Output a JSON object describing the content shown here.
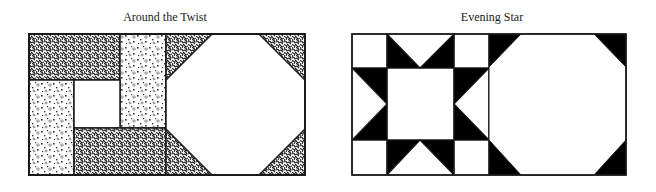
{
  "figures": [
    {
      "title": "Around the Twist",
      "style": "textured",
      "colors": {
        "stroke": "#1a1a1a",
        "dark_texture": "#2a2a2a",
        "light_texture_bg": "#ffffff",
        "plain": "#ffffff"
      },
      "blocks": [
        "around-the-twist-block",
        "snowball-octagon-block"
      ]
    },
    {
      "title": "Evening Star",
      "style": "solid",
      "colors": {
        "stroke": "#1a1a1a",
        "fill_dark": "#000000",
        "plain": "#ffffff"
      },
      "blocks": [
        "evening-star-block",
        "snowball-octagon-block"
      ]
    }
  ]
}
